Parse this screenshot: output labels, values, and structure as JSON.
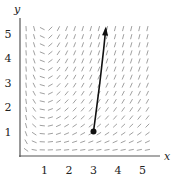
{
  "chart_data": {
    "type": "slope_field",
    "title": "",
    "xlabel": "x",
    "ylabel": "y",
    "xlim": [
      0,
      5.6
    ],
    "ylim": [
      0,
      5.6
    ],
    "x_ticks": [
      "1",
      "2",
      "3",
      "4",
      "5"
    ],
    "y_ticks": [
      "1",
      "2",
      "3",
      "4",
      "5"
    ],
    "grid": false,
    "slope_field": {
      "expression": "dy/dx = y(x-1)/x",
      "x_range": [
        0.25,
        5.5
      ],
      "y_range": [
        0.25,
        5.3
      ],
      "spacing": 0.33
    },
    "solution_curve": {
      "start_point": {
        "x": 3,
        "y": 1
      },
      "points": [
        [
          3.0,
          1.0
        ],
        [
          3.08,
          1.6
        ],
        [
          3.17,
          2.3
        ],
        [
          3.26,
          3.0
        ],
        [
          3.34,
          3.7
        ],
        [
          3.42,
          4.4
        ],
        [
          3.5,
          5.2
        ]
      ],
      "arrow_at_end": true
    },
    "colors": {
      "axis": "#555555",
      "segments": "#888888",
      "curve": "#111111"
    }
  }
}
